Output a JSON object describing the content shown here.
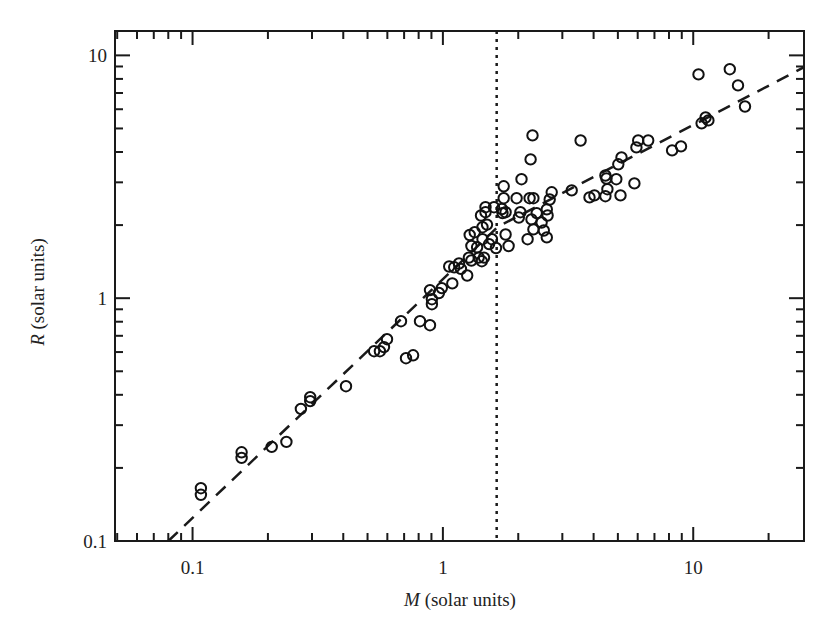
{
  "chart_data": {
    "type": "scatter",
    "title": "",
    "xlabel": "M (solar units)",
    "ylabel": "R (solar units)",
    "xlabel_var": "M",
    "xlabel_rest": " (solar units)",
    "ylabel_var": "R",
    "ylabel_rest": " (solar units)",
    "xscale": "log",
    "yscale": "log",
    "xlim": [
      0.049,
      27.7
    ],
    "ylim": [
      0.1,
      12.6
    ],
    "x_ticks": [
      {
        "value": 0.1,
        "label": "0.1"
      },
      {
        "value": 1,
        "label": "1"
      },
      {
        "value": 10,
        "label": "10"
      }
    ],
    "y_ticks": [
      {
        "value": 0.1,
        "label": "0.1"
      },
      {
        "value": 1,
        "label": "1"
      },
      {
        "value": 10,
        "label": "10"
      }
    ],
    "grid": false,
    "legend": null,
    "vertical_reference_line": {
      "x": 1.64,
      "style": "dotted"
    },
    "fit_line": {
      "style": "dashed",
      "points": [
        [
          0.08,
          0.1
        ],
        [
          1.66,
          1.97
        ],
        [
          27.5,
          8.9
        ]
      ]
    },
    "series": [
      {
        "name": "stars",
        "marker": "open-circle",
        "points": [
          [
            0.108,
            0.165
          ],
          [
            0.108,
            0.155
          ],
          [
            0.157,
            0.232
          ],
          [
            0.157,
            0.22
          ],
          [
            0.207,
            0.244
          ],
          [
            0.237,
            0.256
          ],
          [
            0.271,
            0.35
          ],
          [
            0.295,
            0.391
          ],
          [
            0.295,
            0.377
          ],
          [
            0.41,
            0.434
          ],
          [
            0.531,
            0.605
          ],
          [
            0.56,
            0.605
          ],
          [
            0.582,
            0.629
          ],
          [
            0.598,
            0.678
          ],
          [
            0.68,
            0.804
          ],
          [
            0.712,
            0.566
          ],
          [
            0.76,
            0.582
          ],
          [
            0.81,
            0.804
          ],
          [
            0.888,
            0.774
          ],
          [
            0.904,
            0.945
          ],
          [
            0.904,
            0.99
          ],
          [
            0.888,
            1.08
          ],
          [
            0.964,
            1.05
          ],
          [
            0.99,
            1.1
          ],
          [
            1.09,
            1.15
          ],
          [
            1.06,
            1.35
          ],
          [
            1.11,
            1.34
          ],
          [
            1.16,
            1.39
          ],
          [
            1.18,
            1.32
          ],
          [
            1.25,
            1.24
          ],
          [
            1.27,
            1.47
          ],
          [
            1.3,
            1.43
          ],
          [
            1.39,
            1.47
          ],
          [
            1.43,
            1.42
          ],
          [
            1.46,
            1.47
          ],
          [
            1.3,
            1.64
          ],
          [
            1.37,
            1.62
          ],
          [
            1.44,
            1.75
          ],
          [
            1.53,
            1.67
          ],
          [
            1.28,
            1.82
          ],
          [
            1.34,
            1.87
          ],
          [
            1.44,
            1.96
          ],
          [
            1.5,
            2.01
          ],
          [
            1.42,
            2.19
          ],
          [
            1.48,
            2.26
          ],
          [
            1.48,
            2.37
          ],
          [
            1.63,
            1.61
          ],
          [
            1.83,
            1.64
          ],
          [
            1.57,
            1.75
          ],
          [
            1.78,
            1.83
          ],
          [
            1.6,
            2.37
          ],
          [
            1.72,
            2.33
          ],
          [
            1.73,
            2.24
          ],
          [
            1.78,
            2.26
          ],
          [
            1.75,
            2.58
          ],
          [
            1.75,
            2.89
          ],
          [
            2.06,
            3.09
          ],
          [
            2.24,
            3.73
          ],
          [
            2.28,
            4.68
          ],
          [
            2.04,
            2.26
          ],
          [
            2.01,
            2.15
          ],
          [
            1.97,
            2.58
          ],
          [
            2.22,
            2.58
          ],
          [
            2.3,
            2.58
          ],
          [
            2.18,
            1.75
          ],
          [
            2.3,
            1.92
          ],
          [
            2.53,
            1.9
          ],
          [
            2.37,
            2.24
          ],
          [
            2.26,
            2.11
          ],
          [
            2.48,
            2.05
          ],
          [
            2.6,
            1.78
          ],
          [
            2.62,
            2.19
          ],
          [
            2.6,
            2.32
          ],
          [
            2.72,
            2.73
          ],
          [
            2.67,
            2.55
          ],
          [
            3.27,
            2.78
          ],
          [
            3.55,
            4.46
          ],
          [
            3.85,
            2.6
          ],
          [
            4.03,
            2.65
          ],
          [
            4.46,
            2.63
          ],
          [
            4.54,
            2.81
          ],
          [
            4.46,
            3.2
          ],
          [
            4.5,
            3.11
          ],
          [
            4.93,
            3.09
          ],
          [
            5.12,
            2.65
          ],
          [
            5.02,
            3.56
          ],
          [
            5.17,
            3.8
          ],
          [
            5.82,
            2.97
          ],
          [
            5.93,
            4.18
          ],
          [
            6.03,
            4.46
          ],
          [
            6.61,
            4.46
          ],
          [
            8.23,
            4.06
          ],
          [
            8.94,
            4.22
          ],
          [
            10.8,
            5.25
          ],
          [
            11.2,
            5.55
          ],
          [
            11.5,
            5.4
          ],
          [
            10.5,
            8.35
          ],
          [
            14.0,
            8.77
          ],
          [
            15.1,
            7.52
          ],
          [
            16.1,
            6.16
          ]
        ]
      }
    ]
  },
  "colors": {
    "axis": "#1a1a1a",
    "marker": "#111111",
    "background": "#ffffff"
  }
}
